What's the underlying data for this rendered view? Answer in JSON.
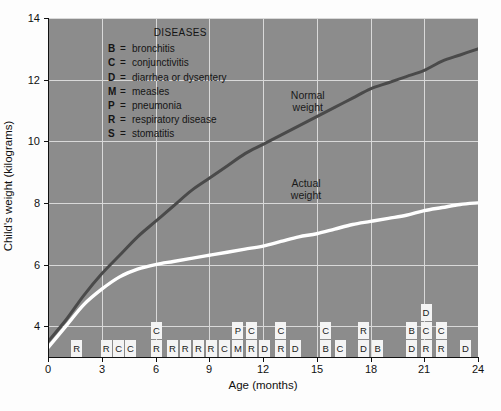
{
  "chart_data": {
    "type": "line",
    "title": "",
    "xlabel": "Age (months)",
    "ylabel": "Child's weight (kilograms)",
    "xlim": [
      0,
      24
    ],
    "ylim": [
      3,
      14
    ],
    "grid": true,
    "xticks": [
      0,
      3,
      6,
      9,
      12,
      15,
      18,
      21,
      24
    ],
    "yticks": [
      4,
      6,
      8,
      10,
      12,
      14
    ],
    "legend_position": "inline-annotations",
    "series": [
      {
        "name": "Normal weight",
        "color": "#4a4a4a",
        "label_x": 14.5,
        "label_y": 11.3,
        "x": [
          0,
          1,
          2,
          3,
          4,
          5,
          6,
          7,
          8,
          9,
          10,
          11,
          12,
          13,
          14,
          15,
          16,
          17,
          18,
          19,
          20,
          21,
          22,
          23,
          24
        ],
        "y": [
          3.5,
          4.2,
          5.0,
          5.7,
          6.3,
          6.9,
          7.4,
          7.9,
          8.4,
          8.8,
          9.2,
          9.6,
          9.9,
          10.2,
          10.5,
          10.8,
          11.1,
          11.4,
          11.7,
          11.9,
          12.1,
          12.3,
          12.6,
          12.8,
          13.0
        ]
      },
      {
        "name": "Actual weight",
        "color": "#ffffff",
        "label_x": 14.4,
        "label_y": 8.45,
        "x": [
          0,
          1,
          2,
          3,
          4,
          5,
          6,
          7,
          8,
          9,
          10,
          11,
          12,
          13,
          14,
          15,
          16,
          17,
          18,
          19,
          20,
          21,
          22,
          23,
          24
        ],
        "y": [
          3.3,
          4.0,
          4.7,
          5.2,
          5.6,
          5.85,
          6.0,
          6.1,
          6.2,
          6.3,
          6.4,
          6.5,
          6.6,
          6.75,
          6.9,
          7.0,
          7.15,
          7.3,
          7.4,
          7.5,
          7.6,
          7.75,
          7.85,
          7.95,
          8.0
        ]
      }
    ],
    "disease_events": [
      {
        "x": 1.6,
        "codes": [
          "R"
        ]
      },
      {
        "x": 3.25,
        "codes": [
          "R"
        ]
      },
      {
        "x": 3.95,
        "codes": [
          "C"
        ]
      },
      {
        "x": 4.6,
        "codes": [
          "C"
        ]
      },
      {
        "x": 6.05,
        "codes": [
          "R",
          "C"
        ]
      },
      {
        "x": 6.95,
        "codes": [
          "R"
        ]
      },
      {
        "x": 7.65,
        "codes": [
          "R"
        ]
      },
      {
        "x": 8.4,
        "codes": [
          "R"
        ]
      },
      {
        "x": 9.1,
        "codes": [
          "R"
        ]
      },
      {
        "x": 9.85,
        "codes": [
          "C"
        ]
      },
      {
        "x": 10.6,
        "codes": [
          "M",
          "P"
        ]
      },
      {
        "x": 11.35,
        "codes": [
          "R",
          "C"
        ]
      },
      {
        "x": 12.1,
        "codes": [
          "D"
        ]
      },
      {
        "x": 13.0,
        "codes": [
          "R",
          "C"
        ]
      },
      {
        "x": 13.8,
        "codes": [
          "D"
        ]
      },
      {
        "x": 15.5,
        "codes": [
          "B",
          "C"
        ]
      },
      {
        "x": 16.3,
        "codes": [
          "C"
        ]
      },
      {
        "x": 17.6,
        "codes": [
          "D",
          "R"
        ]
      },
      {
        "x": 18.4,
        "codes": [
          "B"
        ]
      },
      {
        "x": 20.3,
        "codes": [
          "D",
          "B"
        ]
      },
      {
        "x": 21.1,
        "codes": [
          "R",
          "C",
          "D"
        ]
      },
      {
        "x": 21.95,
        "codes": [
          "R",
          "C"
        ]
      },
      {
        "x": 23.3,
        "codes": [
          "D"
        ]
      }
    ]
  },
  "legend": {
    "title": "DISEASES",
    "entries": [
      {
        "key": "B",
        "eq": "=",
        "label": "bronchitis"
      },
      {
        "key": "C",
        "eq": "=",
        "label": "conjunctivitis"
      },
      {
        "key": "D",
        "eq": "=",
        "label": "diarrhea or dysentery"
      },
      {
        "key": "M",
        "eq": "=",
        "label": "measles"
      },
      {
        "key": "P",
        "eq": "=",
        "label": "pneumonia"
      },
      {
        "key": "R",
        "eq": "=",
        "label": "respiratory disease"
      },
      {
        "key": "S",
        "eq": "=",
        "label": "stomatitis"
      }
    ]
  },
  "colors": {
    "plot_background": "#8c8c8c",
    "gridline": "#d9d9d9",
    "normal_weight": "#4a4a4a",
    "actual_weight": "#ffffff",
    "marker_box": "#f4f4f4",
    "text": "#111111"
  }
}
